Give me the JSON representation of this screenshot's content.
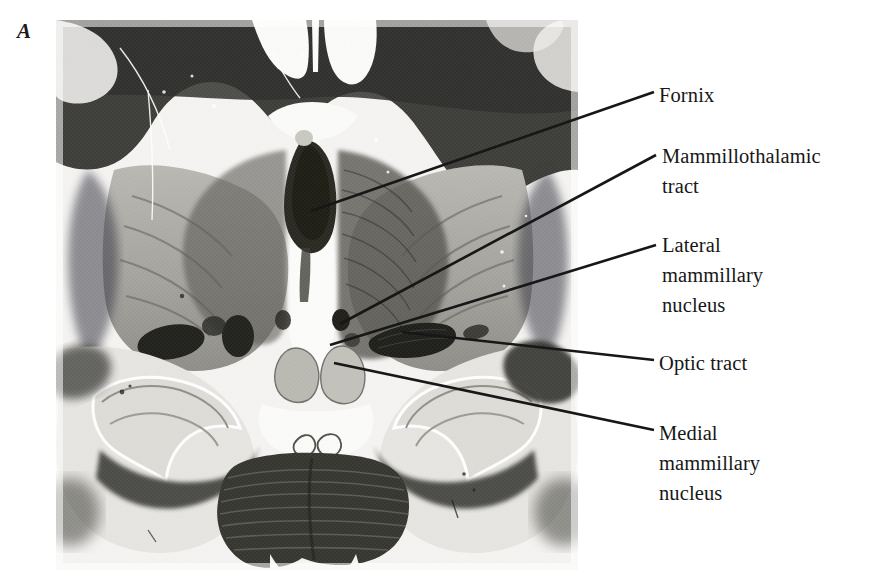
{
  "figure": {
    "panel_letter": "A",
    "type": "anatomical-photomicrograph",
    "plate_background": "#ffffff",
    "ink_color": "#171717"
  },
  "specimen": {
    "name": "coronal-brain-section",
    "stain_tone_light": "#f3f2f0",
    "stain_tone_mid": "#9a9a96",
    "stain_tone_dark": "#2e2e2c",
    "region": {
      "x": 56,
      "y": 20,
      "width": 522,
      "height": 550
    }
  },
  "labels": [
    {
      "id": "fornix",
      "text": "Fornix",
      "leader": {
        "x1": 654,
        "y1": 92,
        "x2": 311,
        "y2": 211
      }
    },
    {
      "id": "mammillothalamic-tract",
      "text": "Mammillothalamic\ntract",
      "leader": {
        "x1": 656,
        "y1": 155,
        "x2": 340,
        "y2": 324
      }
    },
    {
      "id": "lateral-mammillary-nucleus",
      "text": "Lateral\nmammillary\nnucleus",
      "leader": {
        "x1": 656,
        "y1": 245,
        "x2": 330,
        "y2": 345
      }
    },
    {
      "id": "optic-tract",
      "text": "Optic tract",
      "leader": {
        "x1": 654,
        "y1": 360,
        "x2": 402,
        "y2": 332
      }
    },
    {
      "id": "medial-mammillary-nucleus",
      "text": "Medial\nmammillary\nnucleus",
      "leader": {
        "x1": 654,
        "y1": 430,
        "x2": 334,
        "y2": 363
      }
    }
  ]
}
